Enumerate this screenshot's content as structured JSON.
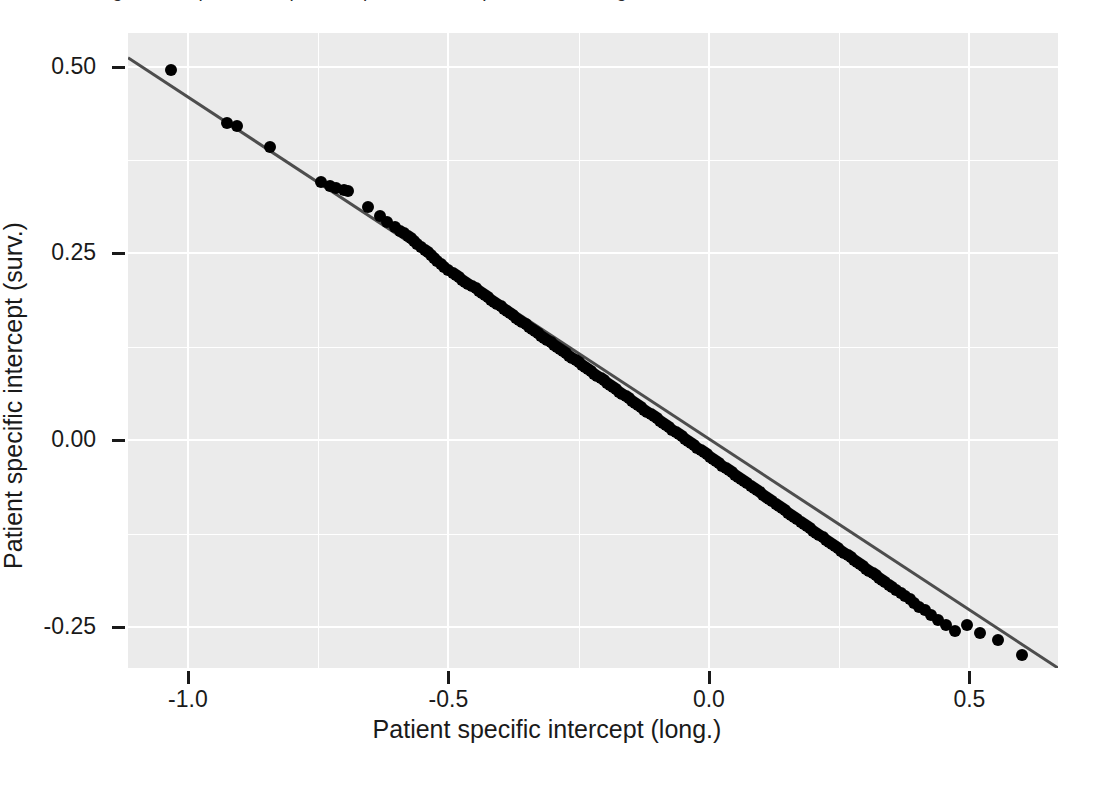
{
  "figure": {
    "caption_bleed_text": "Figure: comparison of patient specific intercepts from the longitudinal and survival submodels",
    "panel_background": "#ebebeb",
    "gridline_color": "#ffffff",
    "point_color": "#000000",
    "line_color": "#4d4d4d"
  },
  "axes": {
    "x_title": "Patient specific intercept (long.)",
    "y_title": "Patient specific intercept (surv.)",
    "x_ticks": [
      "-1.0",
      "-0.5",
      "0.0",
      "0.5"
    ],
    "x_tick_values": [
      -1.0,
      -0.5,
      0.0,
      0.5
    ],
    "y_ticks": [
      "0.50",
      "0.25",
      "0.00",
      "-0.25"
    ],
    "y_tick_values": [
      0.5,
      0.25,
      0.0,
      -0.25
    ],
    "x_range": [
      -1.115,
      0.67
    ],
    "y_range": [
      -0.305,
      0.545
    ],
    "x_minor_ticks": [
      -0.75,
      -0.25,
      0.25
    ],
    "y_minor_ticks": [
      0.375,
      0.125,
      -0.125
    ]
  },
  "chart_data": {
    "type": "scatter",
    "title": "",
    "subtitle": "",
    "xlabel": "Patient specific intercept (long.)",
    "ylabel": "Patient specific intercept (surv.)",
    "xlim": [
      -1.115,
      0.67
    ],
    "ylim": [
      -0.305,
      0.545
    ],
    "grid": true,
    "legend": "none",
    "annotations": [],
    "series": [
      {
        "name": "Patients",
        "marker": "filled-circle",
        "marker_size_px": 12,
        "color": "#000000",
        "x": [
          -1.032,
          -0.925,
          -0.905,
          -0.843,
          -0.745,
          -0.727,
          -0.715,
          -0.7,
          -0.692,
          -0.655,
          -0.632,
          -0.618,
          -0.603,
          -0.592,
          -0.585,
          -0.578,
          -0.572,
          -0.566,
          -0.56,
          -0.552,
          -0.545,
          -0.54,
          -0.534,
          -0.528,
          -0.522,
          -0.515,
          -0.508,
          -0.5,
          -0.492,
          -0.486,
          -0.48,
          -0.474,
          -0.468,
          -0.462,
          -0.455,
          -0.448,
          -0.442,
          -0.436,
          -0.43,
          -0.424,
          -0.418,
          -0.412,
          -0.406,
          -0.4,
          -0.394,
          -0.388,
          -0.382,
          -0.376,
          -0.37,
          -0.364,
          -0.358,
          -0.352,
          -0.346,
          -0.34,
          -0.334,
          -0.328,
          -0.322,
          -0.316,
          -0.31,
          -0.304,
          -0.298,
          -0.292,
          -0.286,
          -0.28,
          -0.274,
          -0.268,
          -0.262,
          -0.256,
          -0.25,
          -0.244,
          -0.238,
          -0.232,
          -0.226,
          -0.22,
          -0.214,
          -0.208,
          -0.202,
          -0.196,
          -0.19,
          -0.184,
          -0.178,
          -0.172,
          -0.166,
          -0.16,
          -0.154,
          -0.148,
          -0.142,
          -0.136,
          -0.13,
          -0.124,
          -0.118,
          -0.112,
          -0.106,
          -0.1,
          -0.094,
          -0.088,
          -0.082,
          -0.076,
          -0.07,
          -0.064,
          -0.058,
          -0.052,
          -0.046,
          -0.04,
          -0.034,
          -0.028,
          -0.022,
          -0.016,
          -0.01,
          -0.004,
          0.002,
          0.008,
          0.014,
          0.02,
          0.026,
          0.032,
          0.038,
          0.044,
          0.05,
          0.056,
          0.062,
          0.068,
          0.074,
          0.08,
          0.086,
          0.092,
          0.098,
          0.104,
          0.11,
          0.116,
          0.122,
          0.128,
          0.134,
          0.14,
          0.146,
          0.152,
          0.158,
          0.164,
          0.17,
          0.176,
          0.182,
          0.188,
          0.194,
          0.2,
          0.206,
          0.212,
          0.218,
          0.224,
          0.23,
          0.236,
          0.242,
          0.248,
          0.254,
          0.26,
          0.266,
          0.272,
          0.278,
          0.284,
          0.29,
          0.296,
          0.302,
          0.308,
          0.314,
          0.32,
          0.326,
          0.332,
          0.338,
          0.345,
          0.352,
          0.36,
          0.368,
          0.376,
          0.385,
          0.394,
          0.404,
          0.415,
          0.427,
          0.44,
          0.455,
          0.472,
          0.495,
          0.52,
          0.555,
          0.6
        ],
        "y": [
          0.495,
          0.425,
          0.42,
          0.393,
          0.345,
          0.34,
          0.337,
          0.335,
          0.333,
          0.312,
          0.3,
          0.292,
          0.285,
          0.28,
          0.277,
          0.273,
          0.27,
          0.267,
          0.263,
          0.259,
          0.255,
          0.252,
          0.248,
          0.244,
          0.24,
          0.236,
          0.232,
          0.228,
          0.224,
          0.221,
          0.218,
          0.215,
          0.212,
          0.209,
          0.206,
          0.203,
          0.2,
          0.197,
          0.194,
          0.191,
          0.188,
          0.185,
          0.182,
          0.179,
          0.176,
          0.173,
          0.17,
          0.167,
          0.164,
          0.161,
          0.158,
          0.155,
          0.152,
          0.149,
          0.146,
          0.143,
          0.14,
          0.137,
          0.134,
          0.131,
          0.128,
          0.125,
          0.122,
          0.119,
          0.116,
          0.113,
          0.11,
          0.107,
          0.104,
          0.101,
          0.098,
          0.095,
          0.092,
          0.089,
          0.086,
          0.083,
          0.08,
          0.077,
          0.074,
          0.071,
          0.068,
          0.065,
          0.062,
          0.059,
          0.056,
          0.053,
          0.05,
          0.047,
          0.044,
          0.041,
          0.038,
          0.035,
          0.032,
          0.029,
          0.026,
          0.023,
          0.02,
          0.017,
          0.014,
          0.011,
          0.008,
          0.005,
          0.002,
          -0.001,
          -0.004,
          -0.007,
          -0.01,
          -0.013,
          -0.016,
          -0.019,
          -0.022,
          -0.025,
          -0.028,
          -0.031,
          -0.034,
          -0.037,
          -0.04,
          -0.043,
          -0.046,
          -0.049,
          -0.052,
          -0.055,
          -0.058,
          -0.061,
          -0.064,
          -0.067,
          -0.07,
          -0.073,
          -0.076,
          -0.079,
          -0.082,
          -0.085,
          -0.088,
          -0.091,
          -0.094,
          -0.097,
          -0.1,
          -0.103,
          -0.106,
          -0.109,
          -0.112,
          -0.115,
          -0.118,
          -0.121,
          -0.124,
          -0.127,
          -0.13,
          -0.133,
          -0.136,
          -0.139,
          -0.142,
          -0.145,
          -0.148,
          -0.151,
          -0.154,
          -0.157,
          -0.16,
          -0.163,
          -0.166,
          -0.169,
          -0.172,
          -0.175,
          -0.178,
          -0.181,
          -0.184,
          -0.187,
          -0.19,
          -0.194,
          -0.197,
          -0.201,
          -0.205,
          -0.209,
          -0.213,
          -0.218,
          -0.223,
          -0.228,
          -0.234,
          -0.241,
          -0.248,
          -0.256,
          -0.248,
          -0.258,
          -0.268,
          -0.288
        ]
      }
    ],
    "fit_line": {
      "name": "identity-like regression line",
      "type": "line",
      "color": "#4d4d4d",
      "x_start": -1.115,
      "y_start": 0.512,
      "x_end": 0.67,
      "y_end": -0.305,
      "slope": -0.458,
      "intercept": 0.001
    }
  }
}
